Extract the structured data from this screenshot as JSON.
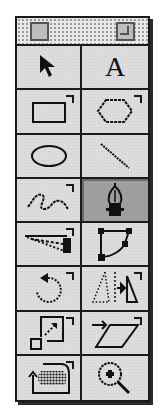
{
  "palette": {
    "title": "",
    "selected_tool": "pen-tool",
    "tools": [
      {
        "name": "pointer-tool",
        "icon": "arrow-pointer-icon",
        "has_submenu": false
      },
      {
        "name": "text-tool",
        "icon": "letter-a-icon",
        "label": "A",
        "has_submenu": false
      },
      {
        "name": "rectangle-tool",
        "icon": "rectangle-icon",
        "has_submenu": true
      },
      {
        "name": "polygon-tool",
        "icon": "hexagon-icon",
        "has_submenu": true
      },
      {
        "name": "ellipse-tool",
        "icon": "ellipse-icon",
        "has_submenu": false
      },
      {
        "name": "line-tool",
        "icon": "diagonal-line-icon",
        "has_submenu": false
      },
      {
        "name": "freehand-tool",
        "icon": "squiggle-icon",
        "has_submenu": true
      },
      {
        "name": "pen-tool",
        "icon": "pen-nib-icon",
        "has_submenu": false,
        "selected": true
      },
      {
        "name": "knife-tool",
        "icon": "knife-icon",
        "has_submenu": true
      },
      {
        "name": "reshape-tool",
        "icon": "path-edit-icon",
        "has_submenu": false
      },
      {
        "name": "rotate-tool",
        "icon": "rotate-icon",
        "has_submenu": true
      },
      {
        "name": "reflect-tool",
        "icon": "mirror-icon",
        "has_submenu": true
      },
      {
        "name": "scale-tool",
        "icon": "scale-icon",
        "has_submenu": true
      },
      {
        "name": "skew-tool",
        "icon": "skew-icon",
        "has_submenu": true
      },
      {
        "name": "trace-tool",
        "icon": "trace-icon",
        "has_submenu": true
      },
      {
        "name": "zoom-tool",
        "icon": "magnifier-plus-icon",
        "has_submenu": false
      }
    ]
  }
}
